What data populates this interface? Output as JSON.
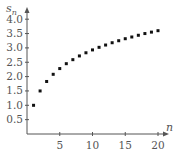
{
  "chart_data": {
    "type": "scatter",
    "title": "",
    "xlabel": "n",
    "ylabel": "s_n",
    "ylabel_base": "s",
    "ylabel_sub": "n",
    "x_ticks": [
      5,
      10,
      15,
      20
    ],
    "x_tick_labels": [
      "5",
      "10",
      "15",
      "20"
    ],
    "y_ticks": [
      0.5,
      1.0,
      1.5,
      2.0,
      2.5,
      3.0,
      3.5,
      4.0
    ],
    "y_tick_labels": [
      "0.5",
      "1.0",
      "1.5",
      "2.0",
      "2.5",
      "3.0",
      "3.5",
      "4.0"
    ],
    "xlim": [
      0,
      21
    ],
    "ylim": [
      0,
      4.3
    ],
    "grid": false,
    "legend": null,
    "series": [
      {
        "name": "s_n",
        "x": [
          1,
          2,
          3,
          4,
          5,
          6,
          7,
          8,
          9,
          10,
          11,
          12,
          13,
          14,
          15,
          16,
          17,
          18,
          19,
          20
        ],
        "values": [
          1.0,
          1.5,
          1.83,
          2.08,
          2.28,
          2.45,
          2.59,
          2.72,
          2.83,
          2.93,
          3.02,
          3.1,
          3.18,
          3.25,
          3.32,
          3.38,
          3.44,
          3.5,
          3.55,
          3.6
        ]
      }
    ]
  },
  "colors": {
    "axis": "#555555",
    "points": "#111111",
    "background": "#ffffff"
  }
}
